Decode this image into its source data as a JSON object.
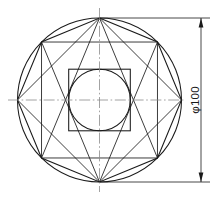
{
  "drawing": {
    "type": "engineering-orthographic-view",
    "title": "",
    "dimensions": [
      {
        "id": "outer-diameter",
        "label": "φ100",
        "symbol": "φ",
        "value": "100",
        "units": "mm",
        "orientation": "vertical",
        "text_rotation_deg": -90,
        "placement": "right-side",
        "arrowheads": "both-ends-inward"
      }
    ],
    "geometry": {
      "center": {
        "x": 99.5,
        "y": 100.0
      },
      "outer_circle": {
        "name": "outer-circle",
        "radius_px": 82.0,
        "nominal_diameter": "100",
        "line_type": "continuous-thick"
      },
      "inner_circle": {
        "name": "inner-circle",
        "radius_px": 30.8,
        "line_type": "continuous-thick",
        "relation": "inscribed-in-inner-square"
      },
      "inner_square": {
        "name": "inner-square",
        "half_side_px": 30.8,
        "rotation_deg": 0,
        "line_type": "continuous-thick"
      },
      "octagon": {
        "name": "inscribed-octagon",
        "sides": 8,
        "vertex_count": 8,
        "circumradius_px": 82.0,
        "start_angle_deg": -90,
        "line_type": "continuous-thick",
        "note": "vertices lie on outer circle; top and bottom vertices on vertical centerline"
      },
      "star_chords": {
        "name": "star-chord-pattern",
        "description": "chords joining octagon vertices forming two overlapping squares / star",
        "line_type": "continuous-thin"
      },
      "centerlines": [
        {
          "id": "horizontal-centerline",
          "orientation": "horizontal",
          "line_type": "dash-dot",
          "x1": 8,
          "y1": 100,
          "x2": 186,
          "y2": 100
        },
        {
          "id": "vertical-centerline",
          "orientation": "vertical",
          "line_type": "dash-dot",
          "x1": 99.5,
          "y1": 8,
          "x2": 99.5,
          "y2": 192
        }
      ]
    },
    "colors": {
      "outline": "#1a1a1a",
      "centerline": "#8c8c8c",
      "background": "#ffffff",
      "dimension": "#1a1a1a"
    }
  }
}
